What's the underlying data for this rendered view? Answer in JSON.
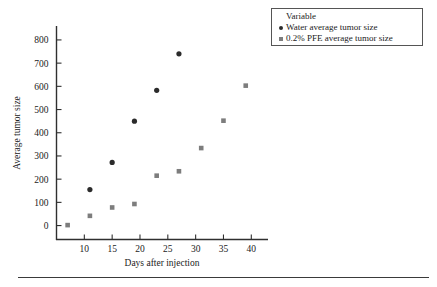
{
  "chart_data": {
    "type": "scatter",
    "title": "",
    "xlabel": "Days after injection",
    "ylabel": "Average tumor size",
    "xlim": [
      5,
      43
    ],
    "ylim": [
      -60,
      860
    ],
    "xticks": [
      10,
      15,
      20,
      25,
      30,
      35,
      40
    ],
    "yticks": [
      0,
      100,
      200,
      300,
      400,
      500,
      600,
      700,
      800
    ],
    "grid": false,
    "legend_position": "top-right",
    "legend_title": "Variable",
    "series": [
      {
        "name": "Water average tumor size",
        "marker": "circle",
        "color": "#2b2b2b",
        "points": [
          {
            "x": 11,
            "y": 155
          },
          {
            "x": 15,
            "y": 272
          },
          {
            "x": 19,
            "y": 450
          },
          {
            "x": 23,
            "y": 583
          },
          {
            "x": 27,
            "y": 740
          }
        ]
      },
      {
        "name": "0.2% PFE average tumor size",
        "marker": "square",
        "color": "#7d7d7d",
        "points": [
          {
            "x": 7,
            "y": 2
          },
          {
            "x": 11,
            "y": 42
          },
          {
            "x": 15,
            "y": 78
          },
          {
            "x": 19,
            "y": 93
          },
          {
            "x": 23,
            "y": 215
          },
          {
            "x": 27,
            "y": 234
          },
          {
            "x": 31,
            "y": 334
          },
          {
            "x": 35,
            "y": 452
          },
          {
            "x": 39,
            "y": 603
          }
        ]
      }
    ]
  },
  "axis": {
    "x_title": "Days after injection",
    "y_title": "Average tumor size",
    "x_tick_labels": [
      "10",
      "15",
      "20",
      "25",
      "30",
      "35",
      "40"
    ],
    "y_tick_labels": [
      "0",
      "100",
      "200",
      "300",
      "400",
      "500",
      "600",
      "700",
      "800"
    ]
  },
  "legend": {
    "title": "Variable",
    "entries": [
      {
        "label": "Water average tumor size",
        "marker": "circle-marker"
      },
      {
        "label": "0.2% PFE average tumor size",
        "marker": "square-marker"
      }
    ]
  }
}
